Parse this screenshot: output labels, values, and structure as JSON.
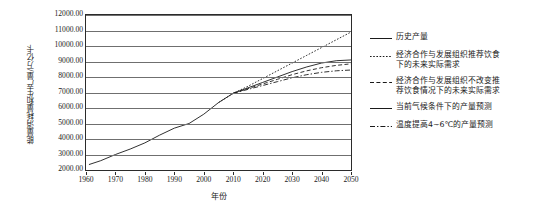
{
  "chart_data": {
    "type": "line",
    "title": "",
    "xlabel": "年份",
    "ylabel": "能量消耗量和生产量/万亿卡",
    "xlim": [
      1960,
      2050
    ],
    "ylim": [
      2000,
      12000
    ],
    "grid": true,
    "legend_position": "right",
    "ytick_labels": [
      "12000.00",
      "11000.00",
      "10000.00",
      "9000.00",
      "8000.00",
      "7000.00",
      "6000.00",
      "5000.00",
      "4000.00",
      "3000.00",
      "2000.00"
    ],
    "ytick_values": [
      12000,
      11000,
      10000,
      9000,
      8000,
      7000,
      6000,
      5000,
      4000,
      3000,
      2000
    ],
    "xtick_labels": [
      "1960",
      "1970",
      "1980",
      "1990",
      "2000",
      "2010",
      "2020",
      "2030",
      "2040",
      "2050"
    ],
    "xtick_values": [
      1960,
      1970,
      1980,
      1990,
      2000,
      2010,
      2020,
      2030,
      2040,
      2050
    ],
    "series": [
      {
        "name": "历史产量",
        "style": "solid",
        "x": [
          1961,
          1965,
          1970,
          1975,
          1980,
          1985,
          1990,
          1995,
          2000,
          2005,
          2010
        ],
        "values": [
          2350,
          2600,
          3000,
          3350,
          3750,
          4250,
          4700,
          5000,
          5600,
          6350,
          6950
        ]
      },
      {
        "name": "经济合作与发展组织推荐饮食下的未来实际需求",
        "style": "dotted",
        "x": [
          2005,
          2010,
          2015,
          2020,
          2025,
          2030,
          2035,
          2040,
          2045,
          2050
        ],
        "values": [
          6350,
          6950,
          7400,
          7900,
          8400,
          8900,
          9400,
          9900,
          10400,
          10900
        ]
      },
      {
        "name": "经济合作与发展组织不改变推荐饮食情况下的未来实际需求",
        "style": "dashed",
        "x": [
          2010,
          2015,
          2020,
          2025,
          2030,
          2035,
          2040,
          2045,
          2050
        ],
        "values": [
          6950,
          7250,
          7550,
          7850,
          8150,
          8400,
          8600,
          8750,
          8850
        ]
      },
      {
        "name": "当前气候条件下的产量预测",
        "style": "solid",
        "x": [
          2010,
          2015,
          2020,
          2025,
          2030,
          2035,
          2040,
          2045,
          2050
        ],
        "values": [
          6950,
          7300,
          7650,
          8000,
          8350,
          8650,
          8900,
          9050,
          9100
        ]
      },
      {
        "name": "温度提高4~6℃的产量预测",
        "style": "dash-dot",
        "x": [
          2010,
          2015,
          2020,
          2025,
          2030,
          2035,
          2040,
          2045,
          2050
        ],
        "values": [
          6950,
          7200,
          7450,
          7700,
          7950,
          8150,
          8300,
          8400,
          8450
        ]
      }
    ]
  },
  "legend": {
    "items": [
      {
        "label": "历史产量",
        "style": "solid"
      },
      {
        "label": "经济合作与发展组织推荐饮食\n下的未来实际需求",
        "style": "dotted"
      },
      {
        "label": "经济合作与发展组织不改变推\n荐饮食情况下的未来实际需求",
        "style": "dashed"
      },
      {
        "label": "当前气候条件下的产量预测",
        "style": "solid"
      },
      {
        "label": "温度提高4~6℃的产量预测",
        "style": "dash-dot"
      }
    ]
  },
  "colors": {
    "line": "#1a1a1a",
    "grid": "#6f6f6f",
    "axis": "#2b2b2b",
    "background": "#ffffff"
  }
}
